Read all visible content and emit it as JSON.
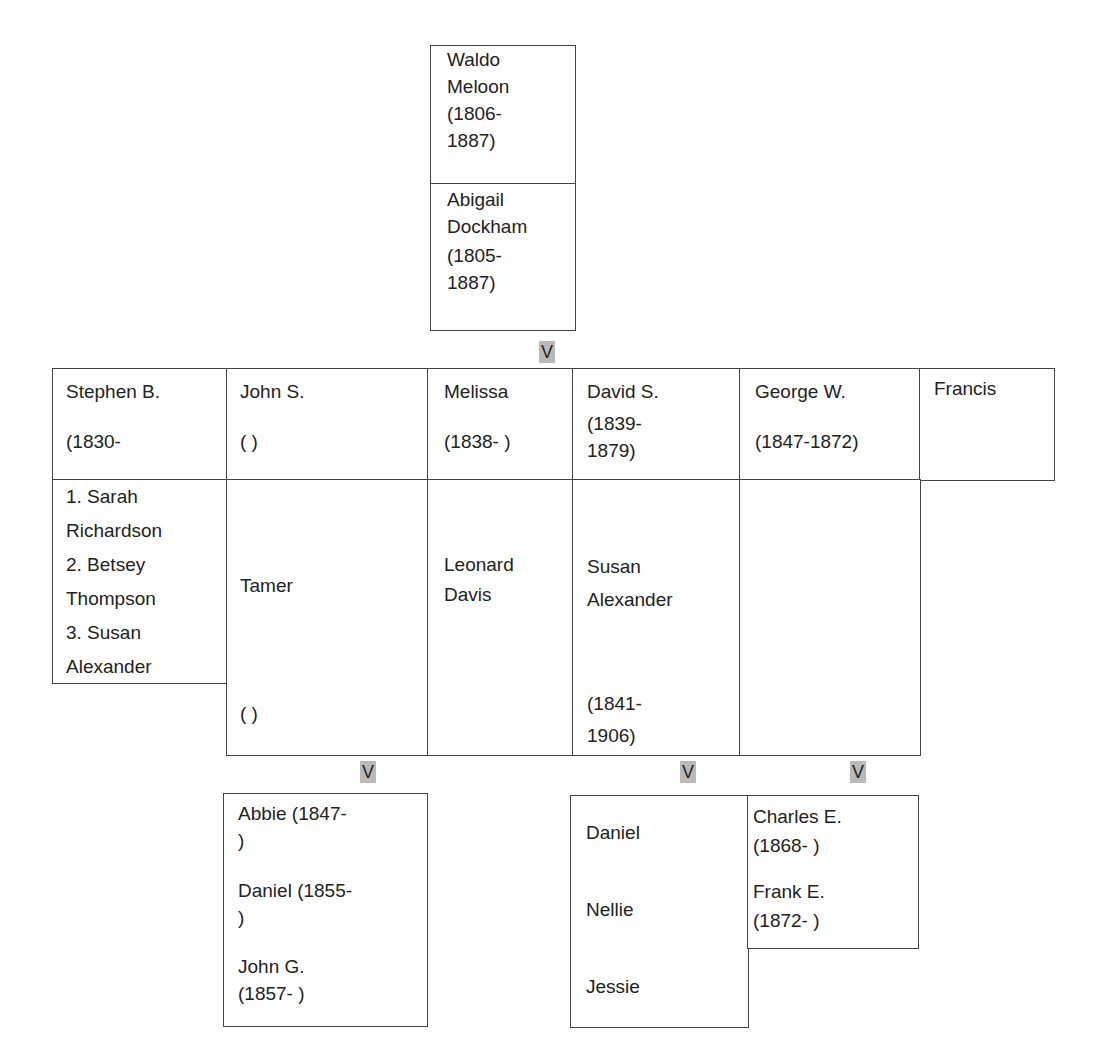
{
  "arrow_glyph": "V",
  "parents": {
    "father": {
      "name": "Waldo\nMeloon",
      "dates": "(1806-\n1887)"
    },
    "mother": {
      "name": "Abigail\nDockham",
      "dates": "(1805-\n1887)"
    }
  },
  "children": [
    {
      "name": "Stephen B.",
      "dates": "(1830-",
      "spouse": "1. Sarah\nRichardson\n2. Betsey\nThompson\n3. Susan\nAlexander",
      "spouse_dates": ""
    },
    {
      "name": "John S.",
      "dates": "(   )",
      "spouse": "Tamer",
      "spouse_dates": "(   )"
    },
    {
      "name": "Melissa",
      "dates": "(1838-   )",
      "spouse": "Leonard\nDavis",
      "spouse_dates": ""
    },
    {
      "name": "David S.",
      "dates": "(1839-\n1879)",
      "spouse": "Susan\nAlexander",
      "spouse_dates": "(1841-\n1906)"
    },
    {
      "name": "George W.",
      "dates": "(1847-1872)",
      "spouse": "",
      "spouse_dates": ""
    },
    {
      "name": "Francis",
      "dates": "",
      "spouse": null,
      "spouse_dates": null
    }
  ],
  "grandchildren": {
    "john_s": [
      "Abbie   (1847-\n)",
      "Daniel   (1855-\n)",
      "John G.\n(1857-  )"
    ],
    "david_s": [
      "Daniel",
      "Nellie",
      "Jessie"
    ],
    "george_w": [
      "Charles E.\n(1868-  )",
      "Frank E.\n(1872-  )"
    ]
  }
}
